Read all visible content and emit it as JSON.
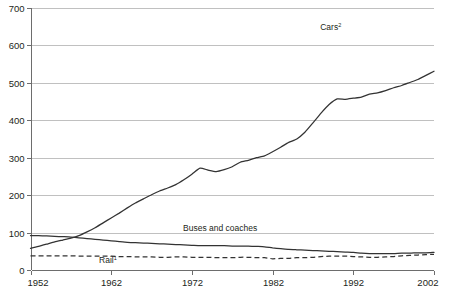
{
  "chart_data": {
    "type": "line",
    "title": "",
    "subtitle": "",
    "xlabel": "",
    "ylabel": "",
    "xlim": [
      1952,
      2002
    ],
    "ylim": [
      0,
      700
    ],
    "grid": true,
    "legend_position": "inline-labels",
    "x_ticks": [
      "1952",
      "1962",
      "1972",
      "1982",
      "1992",
      "2002"
    ],
    "y_ticks": [
      "0",
      "100",
      "200",
      "300",
      "400",
      "500",
      "600",
      "700"
    ],
    "x": [
      1952,
      1953,
      1954,
      1955,
      1956,
      1957,
      1958,
      1959,
      1960,
      1961,
      1962,
      1963,
      1964,
      1965,
      1966,
      1967,
      1968,
      1969,
      1970,
      1971,
      1972,
      1973,
      1974,
      1975,
      1976,
      1977,
      1978,
      1979,
      1980,
      1981,
      1982,
      1983,
      1984,
      1985,
      1986,
      1987,
      1988,
      1989,
      1990,
      1991,
      1992,
      1993,
      1994,
      1995,
      1996,
      1997,
      1998,
      1999,
      2000,
      2001,
      2002
    ],
    "series": [
      {
        "name": "Cars",
        "label": "Cars",
        "superscript": "2",
        "style": "solid",
        "label_x": 1989.2,
        "label_y": 640,
        "values": [
          58,
          63,
          69,
          75,
          80,
          85,
          92,
          102,
          113,
          126,
          139,
          152,
          166,
          179,
          190,
          201,
          211,
          219,
          228,
          241,
          256,
          272,
          267,
          263,
          268,
          276,
          288,
          293,
          300,
          305,
          316,
          328,
          341,
          350,
          368,
          393,
          419,
          442,
          457,
          456,
          459,
          462,
          470,
          473,
          479,
          487,
          493,
          501,
          509,
          520,
          531
        ]
      },
      {
        "name": "Buses and coaches",
        "label": "Buses and coaches",
        "superscript": "",
        "style": "solid",
        "label_x": 1975.5,
        "label_y": 105,
        "values": [
          92,
          92,
          91,
          90,
          89,
          88,
          86,
          84,
          82,
          80,
          78,
          76,
          74,
          73,
          72,
          71,
          70,
          69,
          68,
          67,
          66,
          65,
          65,
          65,
          65,
          64,
          64,
          64,
          63,
          62,
          59,
          57,
          55,
          54,
          53,
          52,
          51,
          50,
          49,
          48,
          47,
          45,
          44,
          44,
          44,
          44,
          45,
          45,
          46,
          46,
          47
        ]
      },
      {
        "name": "Rail",
        "label": "Rail",
        "superscript": "1",
        "style": "dashed",
        "label_x": 1961.6,
        "label_y": 20,
        "values": [
          38,
          38,
          38,
          38,
          38,
          38,
          37,
          37,
          37,
          37,
          37,
          36,
          36,
          35,
          35,
          35,
          34,
          34,
          35,
          35,
          34,
          34,
          34,
          33,
          33,
          33,
          34,
          34,
          33,
          33,
          30,
          31,
          31,
          33,
          33,
          34,
          36,
          37,
          37,
          37,
          36,
          35,
          34,
          34,
          35,
          36,
          38,
          39,
          40,
          41,
          42
        ]
      }
    ]
  }
}
